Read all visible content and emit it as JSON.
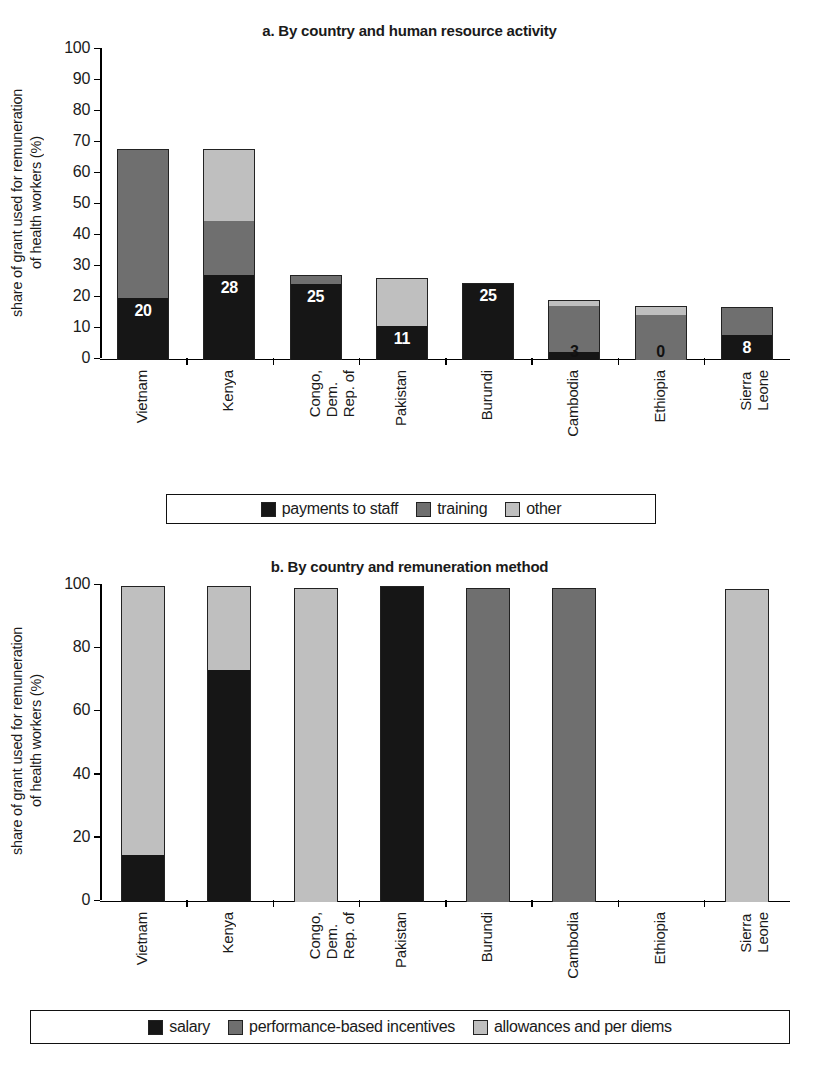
{
  "figure": {
    "ylabel": "share of grant used for remuneration\nof health workers (%)"
  },
  "panel_a": {
    "title": "a. By country and human resource activity",
    "legend": [
      {
        "label": "payments to staff",
        "color": "#161616"
      },
      {
        "label": "training",
        "color": "#6f6f6f"
      },
      {
        "label": "other",
        "color": "#bfbfbf"
      }
    ],
    "yticks": [
      "0",
      "10",
      "20",
      "30",
      "40",
      "50",
      "60",
      "70",
      "80",
      "90",
      "100"
    ],
    "categories": [
      "Vietnam",
      "Kenya",
      "Congo, Dem.\nRep. of",
      "Pakistan",
      "Burundi",
      "Cambodia",
      "Ethiopia",
      "Sierra\nLeone"
    ],
    "bar_labels": [
      "20",
      "28",
      "25",
      "11",
      "25",
      "3",
      "0",
      "8"
    ]
  },
  "panel_b": {
    "title": "b. By country and remuneration method",
    "legend": [
      {
        "label": "salary",
        "color": "#161616"
      },
      {
        "label": "performance-based incentives",
        "color": "#6f6f6f"
      },
      {
        "label": "allowances and per diems",
        "color": "#bfbfbf"
      }
    ],
    "yticks": [
      "0",
      "20",
      "40",
      "60",
      "80",
      "100"
    ],
    "categories": [
      "Vietnam",
      "Kenya",
      "Congo, Dem.\nRep. of",
      "Pakistan",
      "Burundi",
      "Cambodia",
      "Ethiopia",
      "Sierra\nLeone"
    ]
  },
  "chart_data": [
    {
      "type": "bar",
      "stacked": true,
      "panel": "a",
      "title": "a. By country and human resource activity",
      "xlabel": "",
      "ylabel": "share of grant used for remuneration of health workers (%)",
      "ylim": [
        0,
        100
      ],
      "ytick_step": 10,
      "grid": false,
      "legend_position": "bottom",
      "categories": [
        "Vietnam",
        "Kenya",
        "Congo, Dem. Rep. of",
        "Pakistan",
        "Burundi",
        "Cambodia",
        "Ethiopia",
        "Sierra Leone"
      ],
      "series": [
        {
          "name": "payments to staff",
          "color": "#161616",
          "values": [
            20,
            27.5,
            24.5,
            11,
            25,
            2.5,
            0,
            8
          ]
        },
        {
          "name": "training",
          "color": "#6f6f6f",
          "values": [
            48,
            17.5,
            3,
            0,
            0,
            15,
            14.5,
            9
          ]
        },
        {
          "name": "other",
          "color": "#bfbfbf",
          "values": [
            0,
            23,
            0,
            15.5,
            0,
            2,
            3,
            0
          ]
        }
      ],
      "totals": [
        68,
        68,
        27.5,
        26.5,
        25,
        19.5,
        17.5,
        17
      ],
      "data_labels": [
        "20",
        "28",
        "25",
        "11",
        "25",
        "3",
        "0",
        "8"
      ],
      "annotations": "Data labels show the 'payments to staff' share for each country."
    },
    {
      "type": "bar",
      "stacked": true,
      "panel": "b",
      "title": "b. By country and remuneration method",
      "xlabel": "",
      "ylabel": "share of grant used for remuneration of health workers (%)",
      "ylim": [
        0,
        100
      ],
      "ytick_step": 20,
      "grid": false,
      "legend_position": "bottom",
      "categories": [
        "Vietnam",
        "Kenya",
        "Congo, Dem. Rep. of",
        "Pakistan",
        "Burundi",
        "Cambodia",
        "Ethiopia",
        "Sierra Leone"
      ],
      "series": [
        {
          "name": "salary",
          "color": "#161616",
          "values": [
            15,
            73.5,
            0,
            100,
            0,
            0,
            0,
            0
          ]
        },
        {
          "name": "performance-based incentives",
          "color": "#6f6f6f",
          "values": [
            0,
            0,
            0,
            0,
            99.5,
            99.5,
            0,
            0
          ]
        },
        {
          "name": "allowances and per diems",
          "color": "#bfbfbf",
          "values": [
            85,
            26.5,
            99.5,
            0,
            0,
            0,
            0,
            99
          ]
        }
      ],
      "totals": [
        100,
        100,
        99.5,
        100,
        99.5,
        99.5,
        0,
        99
      ]
    }
  ]
}
